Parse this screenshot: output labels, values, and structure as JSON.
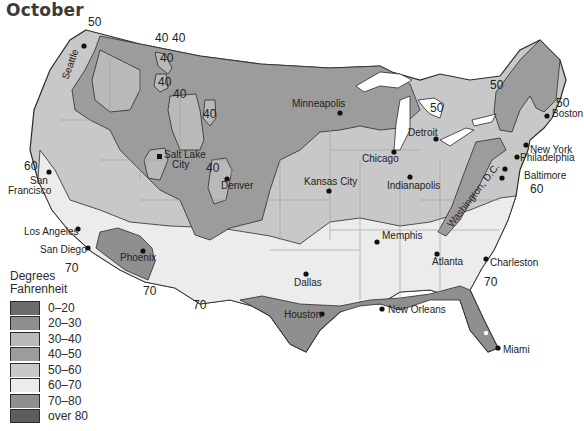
{
  "title": "October",
  "legend": {
    "title_line1": "Degrees",
    "title_line2": "Fahrenheit",
    "items": [
      {
        "label": "0–20",
        "color": "#6b6b6b"
      },
      {
        "label": "20–30",
        "color": "#8e8e8e"
      },
      {
        "label": "30–40",
        "color": "#b9b9b9"
      },
      {
        "label": "40–50",
        "color": "#9c9c9c"
      },
      {
        "label": "50–60",
        "color": "#c8c8c8"
      },
      {
        "label": "60–70",
        "color": "#ececec"
      },
      {
        "label": "70–80",
        "color": "#8f8f8f"
      },
      {
        "label": "over 80",
        "color": "#5e5e5e"
      }
    ]
  },
  "isotherm_labels": [
    {
      "text": "50",
      "x": 88,
      "y": 26
    },
    {
      "text": "40",
      "x": 157,
      "y": 42
    },
    {
      "text": "40",
      "x": 174,
      "y": 42
    },
    {
      "text": "40",
      "x": 161,
      "y": 85
    },
    {
      "text": "40",
      "x": 176,
      "y": 98
    },
    {
      "text": "40",
      "x": 206,
      "y": 118
    },
    {
      "text": "40",
      "x": 228,
      "y": 170
    },
    {
      "text": "40",
      "x": 160,
      "y": 60
    },
    {
      "text": "50",
      "x": 493,
      "y": 89
    },
    {
      "text": "50",
      "x": 430,
      "y": 112
    },
    {
      "text": "50",
      "x": 557,
      "y": 107
    },
    {
      "text": "60",
      "x": 24,
      "y": 170
    },
    {
      "text": "60",
      "x": 530,
      "y": 193
    },
    {
      "text": "70",
      "x": 65,
      "y": 270
    },
    {
      "text": "70",
      "x": 143,
      "y": 293
    },
    {
      "text": "70",
      "x": 193,
      "y": 308
    },
    {
      "text": "70",
      "x": 484,
      "y": 286
    }
  ],
  "cities": [
    {
      "name": "Seattle",
      "x": 84,
      "y": 46
    },
    {
      "name": "San Francisco",
      "x": 49,
      "y": 172
    },
    {
      "name": "Los Angeles",
      "x": 78,
      "y": 228
    },
    {
      "name": "San Diego",
      "x": 88,
      "y": 248
    },
    {
      "name": "Phoenix",
      "x": 143,
      "y": 251
    },
    {
      "name": "Salt Lake City",
      "x": 160,
      "y": 157
    },
    {
      "name": "Denver",
      "x": 227,
      "y": 178
    },
    {
      "name": "Kansas City",
      "x": 329,
      "y": 191
    },
    {
      "name": "Minneapolis",
      "x": 340,
      "y": 113
    },
    {
      "name": "Chicago",
      "x": 394,
      "y": 152
    },
    {
      "name": "Detroit",
      "x": 435,
      "y": 140
    },
    {
      "name": "Indianapolis",
      "x": 410,
      "y": 177
    },
    {
      "name": "Memphis",
      "x": 377,
      "y": 241
    },
    {
      "name": "Dallas",
      "x": 306,
      "y": 273
    },
    {
      "name": "Houston",
      "x": 322,
      "y": 314
    },
    {
      "name": "New Orleans",
      "x": 382,
      "y": 309
    },
    {
      "name": "Atlanta",
      "x": 437,
      "y": 254
    },
    {
      "name": "Charleston",
      "x": 486,
      "y": 259
    },
    {
      "name": "Miami",
      "x": 498,
      "y": 349
    },
    {
      "name": "Washington, D.C.",
      "x": 502,
      "y": 178
    },
    {
      "name": "Baltimore",
      "x": 505,
      "y": 170
    },
    {
      "name": "Philadelphia",
      "x": 517,
      "y": 157
    },
    {
      "name": "New York",
      "x": 526,
      "y": 145
    },
    {
      "name": "Boston",
      "x": 547,
      "y": 115
    }
  ],
  "city_labels": {
    "seattle": "Seattle",
    "san_francisco_1": "San",
    "san_francisco_2": "Francisco",
    "los_angeles": "Los Angeles",
    "san_diego": "San Diego",
    "phoenix": "Phoenix",
    "salt_lake_1": "Salt Lake",
    "salt_lake_2": "City",
    "denver": "Denver",
    "kansas_city": "Kansas City",
    "minneapolis": "Minneapolis",
    "chicago": "Chicago",
    "detroit": "Detroit",
    "indianapolis": "Indianapolis",
    "memphis": "Memphis",
    "dallas": "Dallas",
    "houston": "Houston",
    "new_orleans": "New Orleans",
    "atlanta": "Atlanta",
    "charleston": "Charleston",
    "miami": "Miami",
    "washington": "Washington, D.C.",
    "baltimore": "Baltimore",
    "philadelphia": "Philadelphia",
    "new_york": "New York",
    "boston": "Boston"
  },
  "colors": {
    "ocean": "#ffffff",
    "border": "#2b2b2b",
    "state_line": "#9a9a9a"
  }
}
